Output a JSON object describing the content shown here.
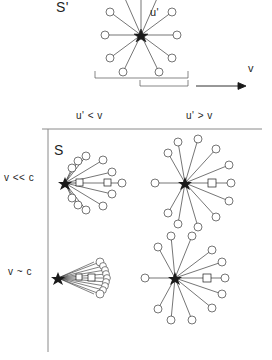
{
  "figure": {
    "type": "diagram",
    "topic": "relativistic-beaming-aberration",
    "top_panel": {
      "frame_label": "S'",
      "emission_label": "u'",
      "velocity_label": "v",
      "center": {
        "x": 141,
        "y": 35
      },
      "ray_count": 12,
      "ray_length": 36,
      "bracket_outer": {
        "x1": 95,
        "x2": 188,
        "y": 77
      },
      "bracket_inner": {
        "x1": 140,
        "x2": 188,
        "y": 85
      },
      "arrow": {
        "x1": 196,
        "x2": 243,
        "y": 86
      }
    },
    "grid": {
      "frame_label": "S",
      "column_headers": [
        "u' < v",
        "u' > v"
      ],
      "row_headers": [
        "v << c",
        "v ~ c"
      ],
      "vline_x": 48,
      "hline_y": 129
    },
    "panels": [
      {
        "id": "v-small-u-less",
        "row": "v << c",
        "column": "u' < v",
        "center": {
          "x": 65,
          "y": 183
        },
        "square_marker": {
          "x": 108,
          "y": 183
        },
        "cone_half_angle_deg": 52,
        "ray_count": 11,
        "ray_length": 44,
        "collimated": false
      },
      {
        "id": "v-small-u-greater",
        "row": "v << c",
        "column": "u' > v",
        "center": {
          "x": 185,
          "y": 183
        },
        "square_marker": {
          "x": 222,
          "y": 183
        },
        "cone_half_angle_deg": 122,
        "ray_count": 13,
        "ray_length": 46,
        "collimated": false
      },
      {
        "id": "v-near-c-u-less",
        "row": "v ~ c",
        "column": "u' < v",
        "center": {
          "x": 58,
          "y": 278
        },
        "square_marker": {
          "x": 92,
          "y": 278
        },
        "cone_half_angle_deg": 22,
        "ray_count": 11,
        "ray_length": 46,
        "collimated": true
      },
      {
        "id": "v-near-c-u-greater",
        "row": "v ~ c",
        "column": "u' > v",
        "center": {
          "x": 175,
          "y": 278
        },
        "square_marker": {
          "x": 212,
          "y": 278
        },
        "cone_half_angle_deg": 100,
        "ray_count": 12,
        "ray_length": 48,
        "collimated": false
      }
    ],
    "colors": {
      "stroke": "#1a1a1a",
      "background": "#ffffff",
      "divider": "#777777"
    }
  }
}
